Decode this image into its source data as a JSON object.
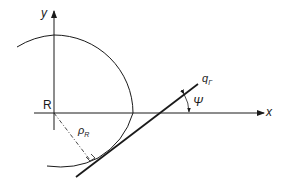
{
  "diagram": {
    "axes": {
      "x_label": "x",
      "y_label": "y",
      "origin_label": "R"
    },
    "circle": {
      "radius_label": "ρ",
      "radius_subscript": "R"
    },
    "tangent_line": {
      "label": "q",
      "label_subscript": "Γ"
    },
    "angle": {
      "label": "Ψ"
    },
    "colors": {
      "stroke": "#1a1a1a",
      "background": "#ffffff"
    }
  }
}
